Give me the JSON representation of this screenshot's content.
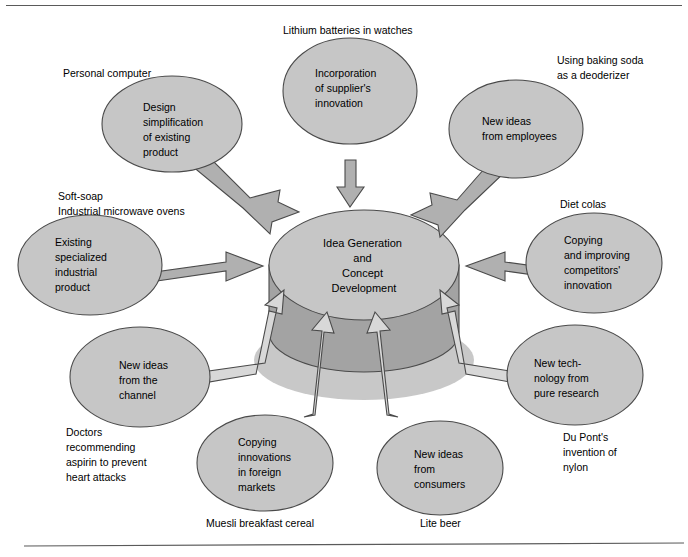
{
  "figure": {
    "center": {
      "name": "idea-generation-cylinder",
      "lines": [
        "Idea Generation",
        "and",
        "Concept",
        "Development"
      ]
    },
    "colors": {
      "node_fill": "#c6c6c6",
      "cylinder_side": "#a3a3a3",
      "arrow_fill": "#b0b0b0",
      "arrow_hollow_fill": "#d8d8d8",
      "outline": "#4a4a4a",
      "text": "#000000",
      "background": "#ffffff"
    },
    "nodes": [
      {
        "id": "design-simplification",
        "lines": [
          "Design",
          "simplification",
          "of existing",
          "product"
        ],
        "caption_lines": [
          "Personal computer"
        ],
        "position": "top-left"
      },
      {
        "id": "supplier-innovation",
        "lines": [
          "Incorporation",
          "of supplier's",
          "innovation"
        ],
        "caption_lines": [
          "Lithium batteries in watches"
        ],
        "position": "top-center"
      },
      {
        "id": "ideas-from-employees",
        "lines": [
          "New ideas",
          "from employees"
        ],
        "caption_lines": [
          "Using baking soda",
          "as a deoderizer"
        ],
        "position": "top-right"
      },
      {
        "id": "existing-industrial-product",
        "lines": [
          "Existing",
          "specialized",
          "industrial",
          "product"
        ],
        "caption_lines": [
          "Soft-soap",
          "Industrial microwave ovens"
        ],
        "position": "middle-left"
      },
      {
        "id": "copying-competitors",
        "lines": [
          "Copying",
          "and improving",
          "competitors'",
          "innovation"
        ],
        "caption_lines": [
          "Diet colas"
        ],
        "position": "middle-right"
      },
      {
        "id": "ideas-from-channel",
        "lines": [
          "New ideas",
          "from the",
          "channel"
        ],
        "caption_lines": [
          "Doctors",
          "recommending",
          "aspirin to prevent",
          "heart attacks"
        ],
        "position": "bottom-left"
      },
      {
        "id": "new-technology-pure-research",
        "lines": [
          "New tech-",
          "nology from",
          "pure research"
        ],
        "caption_lines": [
          "Du Pont's",
          "invention of",
          "nylon"
        ],
        "position": "bottom-right"
      },
      {
        "id": "copying-foreign-markets",
        "lines": [
          "Copying",
          "innovations",
          "in foreign",
          "markets"
        ],
        "caption_lines": [
          "Muesli breakfast cereal"
        ],
        "position": "bottom-center-left"
      },
      {
        "id": "ideas-from-consumers",
        "lines": [
          "New ideas",
          "from",
          "consumers"
        ],
        "caption_lines": [
          "Lite beer"
        ],
        "position": "bottom-center-right"
      }
    ]
  }
}
